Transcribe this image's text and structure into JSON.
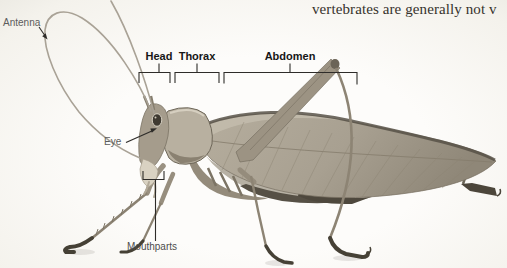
{
  "page": {
    "body_text": "vertebrates are generally not v"
  },
  "figure": {
    "labels": {
      "antenna": "Antenna",
      "eye": "Eye",
      "mouthparts": "Mouthparts",
      "head": "Head",
      "thorax": "Thorax",
      "abdomen": "Abdomen"
    },
    "colors": {
      "annotation_line": "#2e2c29",
      "plain_label": "#5c5c5c",
      "bold_label": "#161616",
      "body_text": "#36322c",
      "insect_body": "#9c9383",
      "insect_wing_light": "#c3bcad",
      "insect_dark": "#575146",
      "insect_feet": "#464136",
      "background": "#fbfaf7"
    }
  }
}
